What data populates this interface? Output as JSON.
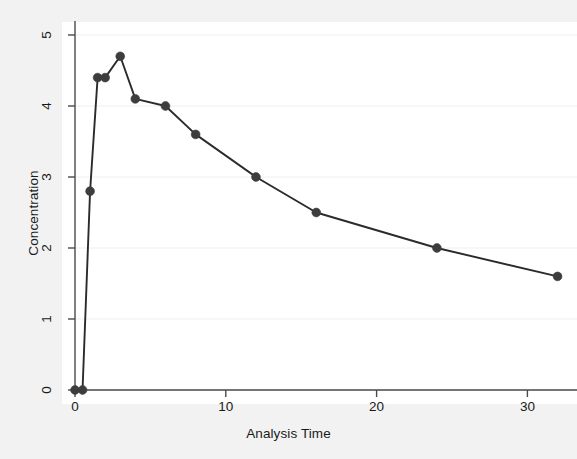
{
  "chart_data": {
    "type": "line",
    "title": "",
    "subtitle": "",
    "xlabel": "Analysis Time",
    "ylabel": "Concentration",
    "xlim": [
      -1.2,
      33.5
    ],
    "ylim": [
      -0.25,
      5.25
    ],
    "xticks": [
      0,
      10,
      20,
      30
    ],
    "xtick_labels": [
      "0",
      "10",
      "20",
      "30"
    ],
    "yticks": [
      0,
      1,
      2,
      3,
      4,
      5
    ],
    "ytick_labels": [
      "0",
      "1",
      "2",
      "3",
      "4",
      "5"
    ],
    "grid": "horizontal-faint",
    "legend": "none",
    "marker": "filled-circle",
    "marker_color": "#3d3d3d",
    "line_color": "#2b2b2b",
    "plot_background": "#ffffff",
    "figure_background": "#f2f2f2",
    "x": [
      0,
      0.5,
      1,
      1.5,
      2,
      3,
      4,
      6,
      8,
      12,
      16,
      24,
      32
    ],
    "values": [
      0,
      0,
      2.8,
      4.4,
      4.4,
      4.7,
      4.1,
      4.0,
      3.6,
      3.0,
      2.5,
      2.0,
      1.6
    ],
    "series": [
      {
        "name": "Concentration",
        "points": [
          {
            "x": 0,
            "y": 0
          },
          {
            "x": 0.5,
            "y": 0
          },
          {
            "x": 1,
            "y": 2.8
          },
          {
            "x": 1.5,
            "y": 4.4
          },
          {
            "x": 2,
            "y": 4.4
          },
          {
            "x": 3,
            "y": 4.7
          },
          {
            "x": 4,
            "y": 4.1
          },
          {
            "x": 6,
            "y": 4.0
          },
          {
            "x": 8,
            "y": 3.6
          },
          {
            "x": 12,
            "y": 3.0
          },
          {
            "x": 16,
            "y": 2.5
          },
          {
            "x": 24,
            "y": 2.0
          },
          {
            "x": 32,
            "y": 1.6
          }
        ]
      }
    ]
  }
}
